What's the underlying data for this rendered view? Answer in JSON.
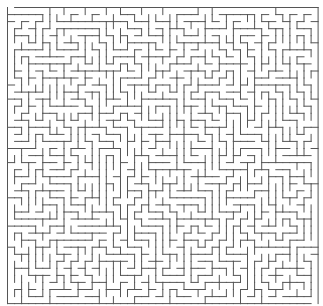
{
  "maze": {
    "type": "rectangular-grid-maze",
    "cols": 44,
    "rows": 42,
    "origin_x": 7.5,
    "origin_y": 7.5,
    "cell_w": 7.06,
    "cell_h": 7.05,
    "wall_color": "#555555",
    "background_color": "#ffffff",
    "wall_width": 1,
    "entrance": {
      "side": "top",
      "col": 0
    },
    "exit": {
      "side": "bottom",
      "col": 43
    },
    "seed": 20240611
  }
}
